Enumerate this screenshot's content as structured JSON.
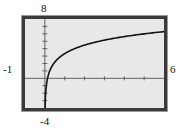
{
  "widget": {
    "name": "graphing-calculator-window",
    "frame_color": "#3a3a3a",
    "plot_background": "#e8e8e6",
    "curve_color": "#111111",
    "axis_color": "#555555"
  },
  "labels": {
    "ymax": "8",
    "ymin": "-4",
    "xmin": "-1",
    "xmax": "6"
  },
  "chart_data": {
    "type": "line",
    "title": "",
    "xlabel": "",
    "ylabel": "",
    "xlim": [
      -1,
      6
    ],
    "ylim": [
      -4,
      8
    ],
    "grid": false,
    "legend": null,
    "axes": {
      "x_axis_at_y": 0,
      "y_axis_at_x": 0,
      "x_tick_spacing": 1,
      "y_tick_spacing": 1,
      "x_ticks": [
        -1,
        0,
        1,
        2,
        3,
        4,
        5,
        6
      ],
      "y_ticks": [
        -4,
        -3,
        -2,
        -1,
        0,
        1,
        2,
        3,
        4,
        5,
        6,
        7,
        8
      ]
    },
    "series": [
      {
        "name": "curve",
        "description": "logarithmic curve with vertical asymptote near x = 0",
        "x": [
          0.02,
          0.04,
          0.07,
          0.1,
          0.15,
          0.2,
          0.3,
          0.45,
          0.6,
          0.8,
          1.0,
          1.3,
          1.6,
          2.0,
          2.5,
          3.0,
          3.5,
          4.0,
          4.5,
          5.0,
          5.5,
          6.0
        ],
        "y": [
          -3.9,
          -3.22,
          -2.66,
          -2.3,
          -1.9,
          -1.61,
          -1.2,
          -0.8,
          -0.51,
          -0.22,
          0.0,
          0.26,
          0.47,
          0.69,
          0.92,
          1.1,
          1.25,
          1.39,
          1.5,
          1.61,
          1.7,
          1.79
        ],
        "y_scale_hint": "plotted values are scaled so the curve rises from -4 at the asymptote to about 6.3 at x = 6"
      }
    ],
    "annotations": [
      {
        "text": "8",
        "position": "top of y-axis, outside frame"
      },
      {
        "text": "-4",
        "position": "bottom of y-axis, outside frame"
      },
      {
        "text": "-1",
        "position": "left end of x-axis, outside frame"
      },
      {
        "text": "6",
        "position": "right end of x-axis, outside frame"
      }
    ]
  }
}
